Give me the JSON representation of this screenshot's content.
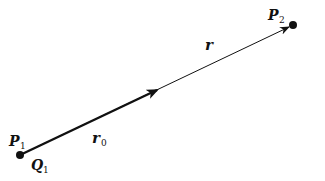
{
  "diagram": {
    "points": {
      "p1": {
        "label": "P",
        "sub": "1"
      },
      "q1": {
        "label": "Q",
        "sub": "1"
      },
      "p2": {
        "label": "P",
        "sub": "2"
      }
    },
    "vectors": {
      "r0": {
        "label": "r",
        "sub": "0"
      },
      "r": {
        "label": "r",
        "sub": ""
      }
    }
  }
}
